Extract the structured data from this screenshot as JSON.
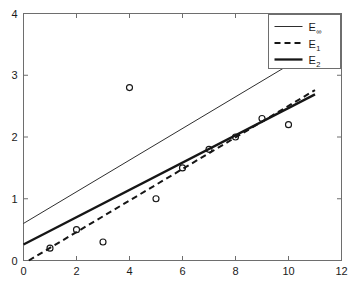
{
  "chart_data": {
    "type": "scatter",
    "title": "",
    "xlabel": "",
    "ylabel": "",
    "xlim": [
      0,
      12
    ],
    "ylim": [
      0,
      4
    ],
    "xticks": [
      0,
      2,
      4,
      6,
      8,
      10,
      12
    ],
    "yticks": [
      0,
      1,
      2,
      3,
      4
    ],
    "xtick_labels": [
      "0",
      "2",
      "4",
      "6",
      "8",
      "10",
      "12"
    ],
    "ytick_labels": [
      "0",
      "1",
      "2",
      "3",
      "4"
    ],
    "grid": false,
    "legend_position": "top-right",
    "points": {
      "name": "data points",
      "marker": "open-circle",
      "x": [
        1,
        2,
        3,
        4,
        5,
        6,
        7,
        8,
        9,
        10
      ],
      "y": [
        0.2,
        0.5,
        0.3,
        2.8,
        1.0,
        1.5,
        1.8,
        2.0,
        2.3,
        2.2
      ]
    },
    "series": [
      {
        "name": "E_inf",
        "label": "E",
        "subscript": "∞",
        "style": "solid-thin",
        "x": [
          0,
          11
        ],
        "y": [
          0.6,
          3.42
        ],
        "slope": 0.2564,
        "intercept": 0.6
      },
      {
        "name": "E_1",
        "label": "E",
        "subscript": "1",
        "style": "dashed",
        "x": [
          0.2,
          11
        ],
        "y": [
          0.0,
          2.76
        ],
        "slope": 0.2556,
        "intercept": -0.0511
      },
      {
        "name": "E_2",
        "label": "E",
        "subscript": "2",
        "style": "solid-thick",
        "x": [
          0,
          11
        ],
        "y": [
          0.26,
          2.69
        ],
        "slope": 0.2209,
        "intercept": 0.26
      }
    ]
  },
  "legend": {
    "entries": [
      {
        "label": "E",
        "subscript": "∞"
      },
      {
        "label": "E",
        "subscript": "1"
      },
      {
        "label": "E",
        "subscript": "2"
      }
    ]
  },
  "axes": {
    "x_labels": [
      "0",
      "2",
      "4",
      "6",
      "8",
      "10",
      "12"
    ],
    "y_labels": [
      "0",
      "1",
      "2",
      "3",
      "4"
    ]
  }
}
